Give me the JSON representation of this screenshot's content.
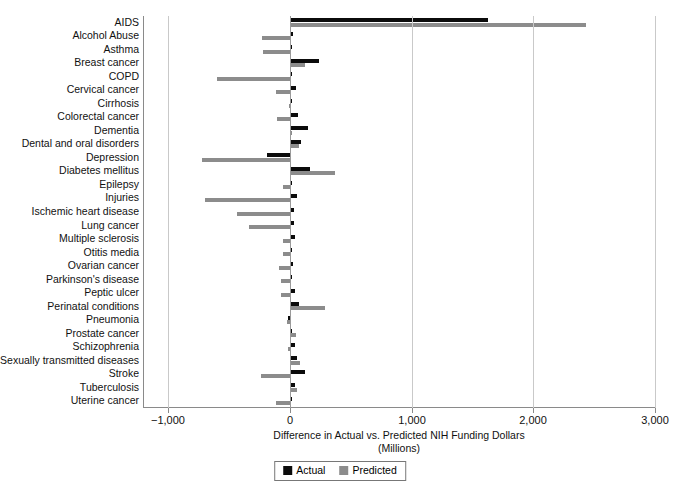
{
  "chart_data": {
    "type": "bar",
    "orientation": "horizontal",
    "title": "",
    "xlabel": "Difference in Actual vs. Predicted NIH Funding Dollars",
    "xlabel_line2": "(Millions)",
    "ylabel": "",
    "xlim": [
      -1000,
      3000
    ],
    "xticks": [
      -1000,
      0,
      1000,
      2000,
      3000
    ],
    "xticklabels": [
      "−1,000",
      "0",
      "1,000",
      "2,000",
      "3,000"
    ],
    "grid": "vertical",
    "legend_position": "bottom-center",
    "legend": [
      "Actual",
      "Predicted"
    ],
    "colors": {
      "actual": "#0b0b0b",
      "predicted": "#8c8c8c",
      "grid": "#c9c9c9",
      "axis": "#8a8a8a"
    },
    "categories": [
      "AIDS",
      "Alcohol Abuse",
      "Asthma",
      "Breast cancer",
      "COPD",
      "Cervical cancer",
      "Cirrhosis",
      "Colorectal cancer",
      "Dementia",
      "Dental and oral disorders",
      "Depression",
      "Diabetes mellitus",
      "Epilepsy",
      "Injuries",
      "Ischemic heart disease",
      "Lung cancer",
      "Multiple sclerosis",
      "Otitis media",
      "Ovarian cancer",
      "Parkinson's disease",
      "Peptic ulcer",
      "Perinatal conditions",
      "Pneumonia",
      "Prostate cancer",
      "Schizophrenia",
      "Sexually transmitted diseases",
      "Stroke",
      "Tuberculosis",
      "Uterine cancer"
    ],
    "series": [
      {
        "name": "Actual",
        "key": "actual",
        "values": [
          1627,
          22,
          10,
          235,
          14,
          48,
          5,
          64,
          150,
          90,
          -191,
          168,
          3,
          60,
          30,
          30,
          40,
          14,
          22,
          10,
          45,
          75,
          -20,
          18,
          45,
          58,
          120,
          40,
          14
        ]
      },
      {
        "name": "Predicted",
        "key": "predicted",
        "values": [
          2432,
          -227,
          -222,
          120,
          -596,
          -112,
          -10,
          -110,
          8,
          70,
          -725,
          370,
          -60,
          -700,
          -435,
          -335,
          -55,
          -60,
          -90,
          -78,
          -72,
          290,
          -25,
          52,
          -20,
          80,
          -240,
          58,
          -112
        ]
      }
    ]
  }
}
